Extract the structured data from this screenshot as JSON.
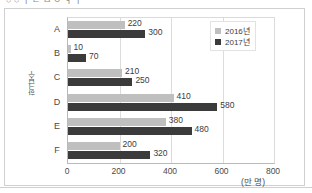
{
  "top_clipped_text": "○ ○ ㅣ ㄹ  ㅁ ㅇ   ㅕ ㅣ",
  "chart_data": {
    "type": "bar",
    "orientation": "horizontal",
    "title": "",
    "categories": [
      "A",
      "B",
      "C",
      "D",
      "E",
      "F"
    ],
    "series": [
      {
        "name": "2016년",
        "color": "#bfbfbf",
        "values": [
          220,
          10,
          210,
          410,
          380,
          200
        ]
      },
      {
        "name": "2017년",
        "color": "#3b3b3b",
        "values": [
          300,
          70,
          250,
          580,
          480,
          320
        ]
      }
    ],
    "xlabel": "(만 명)",
    "ylabel": "학급수",
    "xlim": [
      0,
      800
    ],
    "xticks": [
      0,
      200,
      400,
      600,
      800
    ],
    "xtick_labels": [
      "0",
      "200",
      "400",
      "600",
      "800"
    ],
    "grid": true,
    "legend_position": "top-right",
    "data_labels": true
  },
  "legend": {
    "items": [
      {
        "label": "2016년",
        "color": "#bfbfbf"
      },
      {
        "label": "2017년",
        "color": "#3b3b3b"
      }
    ]
  }
}
